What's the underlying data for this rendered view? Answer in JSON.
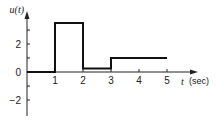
{
  "chart_data": {
    "type": "line",
    "subtype": "step",
    "title": "",
    "ylabel": "u(t)",
    "xlabel": "t",
    "xunit": "(sec)",
    "xlim": [
      0,
      6
    ],
    "ylim": [
      -3,
      4
    ],
    "xticks": [
      1,
      2,
      3,
      4,
      5
    ],
    "xtick_labels": [
      "1",
      "2",
      "3",
      "4",
      "5"
    ],
    "yticks": [
      -2,
      -1,
      0,
      1,
      2,
      3
    ],
    "ytick_labels": [
      "-2",
      "",
      "0",
      "",
      "2",
      ""
    ],
    "grid": false,
    "series": [
      {
        "name": "u(t)",
        "points": [
          [
            0,
            0
          ],
          [
            1,
            0
          ],
          [
            1,
            3.5
          ],
          [
            2,
            3.5
          ],
          [
            2,
            0.25
          ],
          [
            3,
            0.25
          ],
          [
            3,
            1
          ],
          [
            5,
            1
          ]
        ]
      }
    ]
  },
  "layout": {
    "origin_px": [
      27,
      72
    ],
    "px_per_x": 28,
    "px_per_y": 14,
    "x_axis_end_px": 198,
    "y_axis_top_px": 11,
    "y_axis_bottom_px": 116
  }
}
